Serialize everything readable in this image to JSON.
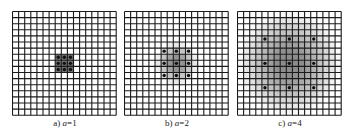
{
  "figure": {
    "grid_cells": 17,
    "cell_px": 6.1,
    "line_color": "#1a1a1a",
    "dot_color": "#111111",
    "panels": [
      {
        "id": "a",
        "prefix": "a) ",
        "variable": "a",
        "value_text": "=1",
        "a": 1,
        "left": 12,
        "shade_center": [
          8,
          8
        ],
        "shade_radius": 1.6,
        "shade_max": 0.55,
        "dots": [
          [
            7,
            7
          ],
          [
            8,
            7
          ],
          [
            9,
            7
          ],
          [
            7,
            8
          ],
          [
            8,
            8
          ],
          [
            9,
            8
          ],
          [
            7,
            9
          ],
          [
            8,
            9
          ],
          [
            9,
            9
          ]
        ]
      },
      {
        "id": "b",
        "prefix": "b) ",
        "variable": "a",
        "value_text": "=2",
        "a": 2,
        "left": 124,
        "shade_center": [
          8,
          8
        ],
        "shade_radius": 3.6,
        "shade_max": 0.45,
        "dots": [
          [
            6,
            6
          ],
          [
            8,
            6
          ],
          [
            10,
            6
          ],
          [
            6,
            8
          ],
          [
            8,
            8
          ],
          [
            10,
            8
          ],
          [
            6,
            10
          ],
          [
            8,
            10
          ],
          [
            10,
            10
          ]
        ]
      },
      {
        "id": "c",
        "prefix": "c) ",
        "variable": "a",
        "value_text": "=4",
        "a": 4,
        "left": 237,
        "shade_center": [
          8,
          8
        ],
        "shade_radius": 8.5,
        "shade_max": 0.45,
        "dots": [
          [
            4,
            4
          ],
          [
            8,
            4
          ],
          [
            12,
            4
          ],
          [
            4,
            8
          ],
          [
            8,
            8
          ],
          [
            12,
            8
          ],
          [
            4,
            12
          ],
          [
            8,
            12
          ],
          [
            12,
            12
          ]
        ]
      }
    ]
  }
}
